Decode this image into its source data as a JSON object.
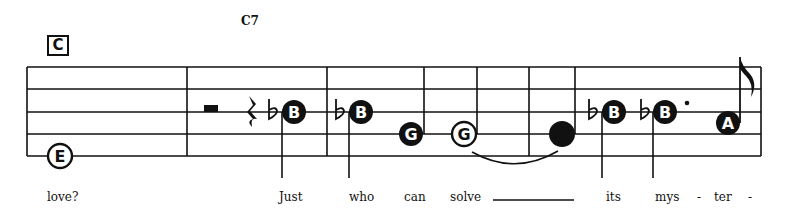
{
  "score": {
    "section_marker": "C",
    "chord_symbols": [
      {
        "label": "C7",
        "x": 241
      }
    ],
    "staff": {
      "lines_y": [
        67,
        89,
        112,
        134,
        156
      ],
      "left_x": 27,
      "right_x": 761,
      "barlines_x": [
        187,
        327,
        529
      ]
    },
    "notes": [
      {
        "letter": "E",
        "style": "hollow",
        "x": 60,
        "y": 156,
        "stem": "none"
      },
      {
        "letter": "B",
        "accidental": "flat",
        "style": "filled",
        "x": 294,
        "y": 112,
        "stem": "down"
      },
      {
        "letter": "B",
        "accidental": "flat",
        "style": "filled",
        "x": 361,
        "y": 112,
        "stem": "down"
      },
      {
        "letter": "G",
        "style": "filled",
        "x": 411,
        "y": 134,
        "stem": "up"
      },
      {
        "letter": "G",
        "style": "hollow",
        "x": 464,
        "y": 134,
        "stem": "up",
        "tied_to_next": true
      },
      {
        "letter": "",
        "style": "filled",
        "x": 562,
        "y": 134,
        "stem": "up"
      },
      {
        "letter": "B",
        "accidental": "flat",
        "style": "filled",
        "x": 614,
        "y": 112,
        "stem": "down"
      },
      {
        "letter": "B",
        "accidental": "flat",
        "style": "filled",
        "x": 665,
        "y": 112,
        "stem": "down",
        "dotted": true
      },
      {
        "letter": "A",
        "style": "filled",
        "x": 728,
        "y": 123,
        "stem": "up",
        "flag": "eighth"
      }
    ],
    "rests": [
      {
        "type": "half",
        "x": 211
      },
      {
        "type": "quarter",
        "x": 252
      }
    ]
  },
  "lyrics": [
    {
      "text": "love?",
      "x": 47
    },
    {
      "text": "Just",
      "x": 279
    },
    {
      "text": "who",
      "x": 349
    },
    {
      "text": "can",
      "x": 404
    },
    {
      "text": "solve",
      "x": 450
    },
    {
      "text": "its",
      "x": 606
    },
    {
      "text": "mys",
      "x": 655
    },
    {
      "text": "-",
      "x": 697
    },
    {
      "text": "ter",
      "x": 714
    },
    {
      "text": "-",
      "x": 748
    }
  ],
  "extender_line": {
    "x1": 493,
    "x2": 574
  }
}
